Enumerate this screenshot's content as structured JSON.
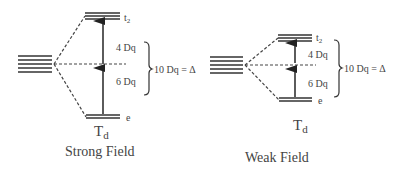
{
  "panels": [
    {
      "name": "strong",
      "caption": "Strong Field",
      "symmetry": "T",
      "symmetry_sub": "d",
      "upper_label": "t",
      "upper_sub": "2",
      "lower_label": "e",
      "upper_gap": "4 Dq",
      "lower_gap": "6 Dq",
      "splitting": "10 Dq = Δ"
    },
    {
      "name": "weak",
      "caption": "Weak Field",
      "symmetry": "T",
      "symmetry_sub": "d",
      "upper_label": "t",
      "upper_sub": "2",
      "lower_label": "e",
      "upper_gap": "4 Dq",
      "lower_gap": "6 Dq",
      "splitting": "10 Dq = Δ"
    }
  ],
  "colors": {
    "line": "#333333",
    "text": "#444444"
  }
}
